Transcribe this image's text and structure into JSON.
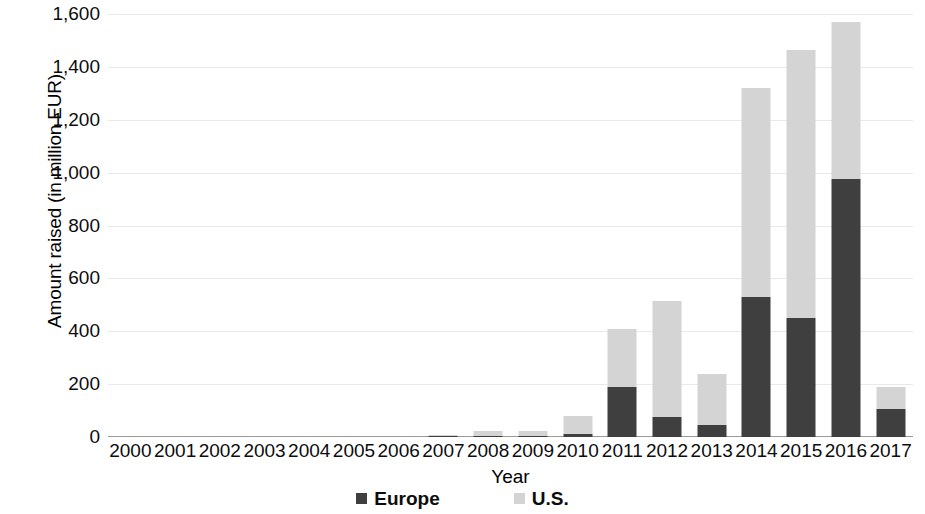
{
  "chart_data": {
    "type": "bar",
    "subtype": "stacked-column",
    "title": "",
    "xlabel": "Year",
    "ylabel": "Amount raised (in million EUR)",
    "ylim": [
      0,
      1600
    ],
    "ytick_step": 200,
    "grid": true,
    "legend_position": "bottom",
    "categories": [
      "2000",
      "2001",
      "2002",
      "2003",
      "2004",
      "2005",
      "2006",
      "2007",
      "2008",
      "2009",
      "2010",
      "2011",
      "2012",
      "2013",
      "2014",
      "2015",
      "2016",
      "2017"
    ],
    "series": [
      {
        "name": "Europe",
        "color": "#3f3f3f",
        "values": [
          0,
          0,
          0,
          0,
          0,
          0,
          0,
          3,
          2,
          2,
          10,
          190,
          75,
          45,
          530,
          450,
          975,
          105
        ]
      },
      {
        "name": "U.S.",
        "color": "#d4d4d4",
        "values": [
          0,
          0,
          0,
          0,
          0,
          0,
          0,
          2,
          18,
          18,
          70,
          220,
          440,
          195,
          790,
          1015,
          595,
          85
        ]
      }
    ],
    "totals": [
      0,
      0,
      0,
      0,
      0,
      0,
      0,
      5,
      20,
      20,
      80,
      410,
      515,
      240,
      1320,
      1465,
      1570,
      190
    ],
    "y_tick_labels": [
      "1,600",
      "1,400",
      "1,200",
      "1,000",
      "800",
      "600",
      "400",
      "200",
      "0"
    ],
    "y_tick_values": [
      1600,
      1400,
      1200,
      1000,
      800,
      600,
      400,
      200,
      0
    ]
  },
  "legend": {
    "entries": [
      {
        "label": "Europe",
        "color": "#3f3f3f"
      },
      {
        "label": "U.S.",
        "color": "#d4d4d4"
      }
    ]
  },
  "axis": {
    "y_title": "Amount raised (in million EUR)",
    "x_title": "Year"
  }
}
